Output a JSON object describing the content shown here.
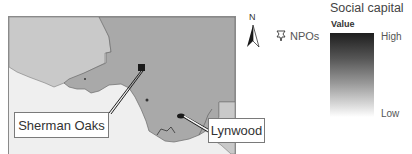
{
  "map": {
    "colors": {
      "ocean": "#efefef",
      "neighbor_county": "#c9c9c9",
      "focus_county": "#a9a9a9",
      "marker": "#1a1a1a"
    },
    "callouts": [
      {
        "label": "Sherman Oaks"
      },
      {
        "label": "Lynwood"
      }
    ]
  },
  "north_arrow": {
    "label": "N"
  },
  "npo_legend": {
    "icon": "npo-marker-icon",
    "label": "NPOs"
  },
  "legend": {
    "title": "Social capital",
    "subtitle": "Value",
    "high_label": "High",
    "low_label": "Low",
    "gradient_colors": [
      "#1e1e1e",
      "#ffffff"
    ]
  }
}
